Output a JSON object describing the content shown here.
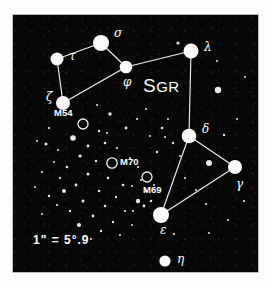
{
  "figure": {
    "kind": "star-chart",
    "constellation_label": "SGR",
    "constellation_label_head": "S",
    "constellation_label_tail": "GR",
    "background_color": "#070707",
    "ink_color": "#fbfbfb",
    "frame_color": "#ffffff",
    "scale_note": "1\" = 5°.9"
  },
  "chart_data": {
    "type": "scatter",
    "title": "SGR",
    "xlabel": "",
    "ylabel": "",
    "xlim": [
      0,
      245
    ],
    "ylim": [
      0,
      257
    ],
    "grid": false,
    "legend": "none",
    "annotations": [
      "SGR",
      "1\" = 5°.9"
    ],
    "named_stars": [
      {
        "label": "σ",
        "name": "sigma",
        "x": 88,
        "y": 28,
        "r": 8.0,
        "lx": 101,
        "ly": 22
      },
      {
        "label": "τ",
        "name": "tau",
        "x": 44,
        "y": 44,
        "r": 6.5,
        "lx": 56,
        "ly": 45
      },
      {
        "label": "φ",
        "name": "phi",
        "x": 113,
        "y": 52,
        "r": 6.3,
        "lx": 110,
        "ly": 71
      },
      {
        "label": "λ",
        "name": "lambda",
        "x": 178,
        "y": 36,
        "r": 7.5,
        "lx": 191,
        "ly": 36
      },
      {
        "label": "ζ",
        "name": "zeta",
        "x": 50,
        "y": 88,
        "r": 7.0,
        "lx": 33,
        "ly": 86
      },
      {
        "label": "δ",
        "name": "delta",
        "x": 176,
        "y": 121,
        "r": 7.3,
        "lx": 189,
        "ly": 118
      },
      {
        "label": "γ",
        "name": "gamma",
        "x": 222,
        "y": 152,
        "r": 7.0,
        "lx": 223,
        "ly": 173
      },
      {
        "label": "ε",
        "name": "epsilon",
        "x": 148,
        "y": 200,
        "r": 8.0,
        "lx": 147,
        "ly": 219
      },
      {
        "label": "η",
        "name": "eta",
        "x": 152,
        "y": 246,
        "r": 5.6,
        "lx": 164,
        "ly": 248
      }
    ],
    "clusters": [
      {
        "label": "M54",
        "x": 70,
        "y": 109,
        "r": 5.0,
        "lx": 41,
        "ly": 101
      },
      {
        "label": "M70",
        "x": 99,
        "y": 148,
        "r": 5.2,
        "lx": 107,
        "ly": 150
      },
      {
        "label": "M69",
        "x": 134,
        "y": 162,
        "r": 5.0,
        "lx": 130,
        "ly": 178
      }
    ],
    "constellation_lines": [
      [
        44,
        44,
        88,
        28
      ],
      [
        88,
        28,
        113,
        52
      ],
      [
        113,
        52,
        178,
        36
      ],
      [
        44,
        44,
        50,
        88
      ],
      [
        50,
        88,
        113,
        52
      ],
      [
        178,
        36,
        176,
        121
      ],
      [
        176,
        121,
        148,
        200
      ],
      [
        176,
        121,
        222,
        152
      ],
      [
        148,
        200,
        222,
        152
      ]
    ],
    "field_stars": [
      {
        "x": 205,
        "y": 75,
        "r": 3.2
      },
      {
        "x": 196,
        "y": 148,
        "r": 3.0
      },
      {
        "x": 165,
        "y": 28,
        "r": 1.6
      },
      {
        "x": 60,
        "y": 123,
        "r": 2.8
      },
      {
        "x": 33,
        "y": 129,
        "r": 1.5
      },
      {
        "x": 97,
        "y": 99,
        "r": 1.7
      },
      {
        "x": 113,
        "y": 113,
        "r": 1.4
      },
      {
        "x": 86,
        "y": 116,
        "r": 1.2
      },
      {
        "x": 124,
        "y": 104,
        "r": 1.1
      },
      {
        "x": 133,
        "y": 94,
        "r": 1.0
      },
      {
        "x": 149,
        "y": 113,
        "r": 1.3
      },
      {
        "x": 152,
        "y": 122,
        "r": 1.1
      },
      {
        "x": 160,
        "y": 128,
        "r": 1.2
      },
      {
        "x": 155,
        "y": 104,
        "r": 1.0
      },
      {
        "x": 144,
        "y": 137,
        "r": 1.2
      },
      {
        "x": 167,
        "y": 141,
        "r": 1.0
      },
      {
        "x": 75,
        "y": 131,
        "r": 1.4
      },
      {
        "x": 92,
        "y": 128,
        "r": 1.3
      },
      {
        "x": 104,
        "y": 133,
        "r": 1.1
      },
      {
        "x": 67,
        "y": 141,
        "r": 1.6
      },
      {
        "x": 83,
        "y": 146,
        "r": 1.2
      },
      {
        "x": 117,
        "y": 143,
        "r": 1.1
      },
      {
        "x": 54,
        "y": 152,
        "r": 1.3
      },
      {
        "x": 75,
        "y": 159,
        "r": 1.5
      },
      {
        "x": 95,
        "y": 163,
        "r": 1.2
      },
      {
        "x": 110,
        "y": 170,
        "r": 1.3
      },
      {
        "x": 125,
        "y": 152,
        "r": 1.1
      },
      {
        "x": 63,
        "y": 170,
        "r": 1.4
      },
      {
        "x": 86,
        "y": 176,
        "r": 1.3
      },
      {
        "x": 103,
        "y": 182,
        "r": 1.2
      },
      {
        "x": 119,
        "y": 171,
        "r": 1.0
      },
      {
        "x": 70,
        "y": 186,
        "r": 1.5
      },
      {
        "x": 92,
        "y": 191,
        "r": 1.3
      },
      {
        "x": 112,
        "y": 196,
        "r": 1.1
      },
      {
        "x": 80,
        "y": 201,
        "r": 1.4
      },
      {
        "x": 57,
        "y": 196,
        "r": 1.2
      },
      {
        "x": 100,
        "y": 207,
        "r": 1.2
      },
      {
        "x": 125,
        "y": 186,
        "r": 2.2
      },
      {
        "x": 131,
        "y": 191,
        "r": 1.4
      },
      {
        "x": 120,
        "y": 196,
        "r": 1.1
      },
      {
        "x": 133,
        "y": 176,
        "r": 1.0
      },
      {
        "x": 47,
        "y": 163,
        "r": 1.1
      },
      {
        "x": 41,
        "y": 147,
        "r": 1.0
      },
      {
        "x": 29,
        "y": 157,
        "r": 1.1
      },
      {
        "x": 22,
        "y": 172,
        "r": 1.0
      },
      {
        "x": 36,
        "y": 181,
        "r": 1.2
      },
      {
        "x": 51,
        "y": 176,
        "r": 2.0
      },
      {
        "x": 44,
        "y": 190,
        "r": 1.1
      },
      {
        "x": 29,
        "y": 199,
        "r": 1.0
      },
      {
        "x": 66,
        "y": 210,
        "r": 2.1
      },
      {
        "x": 88,
        "y": 216,
        "r": 1.2
      },
      {
        "x": 107,
        "y": 220,
        "r": 1.0
      },
      {
        "x": 78,
        "y": 224,
        "r": 1.1
      },
      {
        "x": 119,
        "y": 210,
        "r": 1.0
      },
      {
        "x": 138,
        "y": 186,
        "r": 1.2
      },
      {
        "x": 141,
        "y": 170,
        "r": 1.0
      },
      {
        "x": 128,
        "y": 165,
        "r": 1.0
      },
      {
        "x": 172,
        "y": 163,
        "r": 1.1
      },
      {
        "x": 183,
        "y": 175,
        "r": 1.0
      },
      {
        "x": 193,
        "y": 189,
        "r": 1.1
      },
      {
        "x": 211,
        "y": 120,
        "r": 1.2
      },
      {
        "x": 224,
        "y": 104,
        "r": 1.0
      },
      {
        "x": 215,
        "y": 205,
        "r": 1.0
      },
      {
        "x": 231,
        "y": 186,
        "r": 1.1
      },
      {
        "x": 196,
        "y": 218,
        "r": 1.0
      },
      {
        "x": 161,
        "y": 219,
        "r": 1.1
      },
      {
        "x": 36,
        "y": 113,
        "r": 1.1
      },
      {
        "x": 24,
        "y": 126,
        "r": 1.0
      },
      {
        "x": 45,
        "y": 135,
        "r": 1.0
      },
      {
        "x": 84,
        "y": 90,
        "r": 1.0
      },
      {
        "x": 94,
        "y": 118,
        "r": 1.0
      },
      {
        "x": 137,
        "y": 121,
        "r": 1.0
      },
      {
        "x": 204,
        "y": 46,
        "r": 1.0
      },
      {
        "x": 232,
        "y": 62,
        "r": 1.0
      }
    ]
  }
}
